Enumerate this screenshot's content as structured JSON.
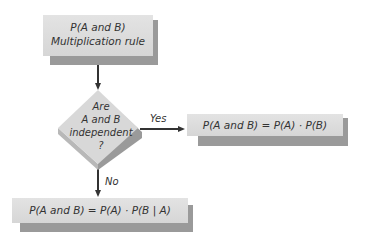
{
  "diagram": {
    "start_box": {
      "line1": "P(A and B)",
      "line2": "Multiplication rule"
    },
    "decision": {
      "line1": "Are",
      "line2": "A and B",
      "line3": "independent",
      "line4": "?"
    },
    "yes_label": "Yes",
    "no_label": "No",
    "yes_box": "P(A and B) = P(A) · P(B)",
    "no_box": "P(A and B) = P(A) · P(B | A)"
  },
  "colors": {
    "box_fill": "#dcdcdc",
    "box_shadow": "#9a9a9a",
    "arrow": "#333333",
    "text": "#333333"
  }
}
